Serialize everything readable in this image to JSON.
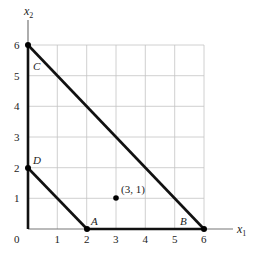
{
  "diagram": {
    "axes": {
      "x_label": "x",
      "x_sub": "1",
      "y_label": "x",
      "y_sub": "2",
      "origin_label": "0",
      "x_ticks": [
        "1",
        "2",
        "3",
        "4",
        "5",
        "6"
      ],
      "y_ticks": [
        "1",
        "2",
        "3",
        "4",
        "5",
        "6"
      ],
      "range": {
        "x": [
          0,
          6
        ],
        "y": [
          0,
          6
        ]
      }
    },
    "vertices": [
      {
        "name": "A",
        "x": 2,
        "y": 0
      },
      {
        "name": "B",
        "x": 6,
        "y": 0
      },
      {
        "name": "C",
        "x": 0,
        "y": 6
      },
      {
        "name": "D",
        "x": 0,
        "y": 2
      }
    ],
    "point": {
      "label": "(3, 1)",
      "x": 3,
      "y": 1
    },
    "lines": [
      {
        "name": "line-C-B",
        "from": [
          0,
          6
        ],
        "to": [
          6,
          0
        ]
      },
      {
        "name": "line-D-A",
        "from": [
          0,
          2
        ],
        "to": [
          2,
          0
        ]
      }
    ],
    "colors": {
      "grid": "#bbbbbb",
      "line": "#111111",
      "axis": "#888888"
    }
  }
}
